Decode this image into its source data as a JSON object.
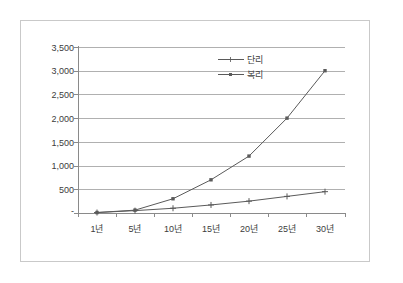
{
  "chart_data": {
    "type": "line",
    "title": "",
    "subtitle": "",
    "xlabel": "",
    "ylabel": "",
    "categories": [
      "1년",
      "5년",
      "10년",
      "15년",
      "20년",
      "25년",
      "30년"
    ],
    "series": [
      {
        "name": "단리",
        "marker": "plus",
        "color": "#5a5a5a",
        "values": [
          10,
          50,
          100,
          170,
          250,
          350,
          450
        ]
      },
      {
        "name": "복리",
        "marker": "square",
        "color": "#5a5a5a",
        "values": [
          10,
          60,
          300,
          700,
          1200,
          2000,
          3000
        ]
      }
    ],
    "ylim": [
      0,
      3500
    ],
    "ytick_values": [
      0,
      500,
      1000,
      1500,
      2000,
      2500,
      3000,
      3500
    ],
    "ytick_labels": [
      "-",
      "500",
      "1,000",
      "1,500",
      "2,000",
      "2,500",
      "3,000",
      "3,500"
    ],
    "grid": true,
    "grid_axis": "y",
    "legend_position": "upper-center",
    "legend_entries": [
      "단리",
      "복리"
    ],
    "colors": {
      "plot_background": "#ffffff",
      "frame_border": "#c9c9c9",
      "gridline": "#b0b0b0",
      "axis": "#8a8a8a",
      "text": "#3c3c3c",
      "series_line": "#5a5a5a"
    }
  }
}
